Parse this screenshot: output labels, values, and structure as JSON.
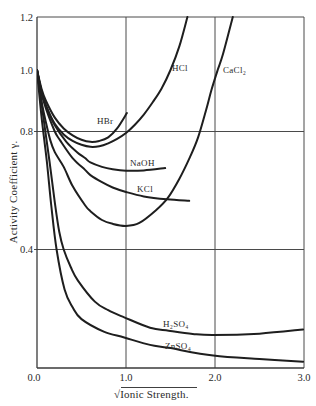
{
  "chart_data": {
    "type": "line",
    "title": "",
    "xlabel": "√Ionic Strength.",
    "ylabel": "Activity Coefficient γ.",
    "xlim": [
      0.0,
      3.0
    ],
    "ylim": [
      0.0,
      1.2
    ],
    "x_ticks": [
      {
        "value": 0.0,
        "label": "0.0"
      },
      {
        "value": 1.0,
        "label": "1.0"
      },
      {
        "value": 2.0,
        "label": "2.0"
      },
      {
        "value": 3.0,
        "label": "3.0"
      }
    ],
    "y_ticks": [
      {
        "value": 1.2,
        "label": "1.2"
      },
      {
        "value": 1.0,
        "label": "1.0"
      },
      {
        "value": 0.8,
        "label": "0.8"
      },
      {
        "value": 0.4,
        "label": "0.4"
      }
    ],
    "grid": {
      "x": [
        1.0,
        2.0,
        3.0
      ],
      "y": [
        0.4,
        0.8,
        1.2
      ]
    },
    "legend": "none — curves labeled inline",
    "series": [
      {
        "name": "HBr",
        "label_pos": [
          0.674,
          0.824
        ],
        "points": [
          [
            0,
            1.0
          ],
          [
            0.05,
            0.94
          ],
          [
            0.1,
            0.9
          ],
          [
            0.2,
            0.845
          ],
          [
            0.3,
            0.81
          ],
          [
            0.4,
            0.787
          ],
          [
            0.5,
            0.772
          ],
          [
            0.6,
            0.765
          ],
          [
            0.7,
            0.768
          ],
          [
            0.8,
            0.78
          ],
          [
            0.9,
            0.81
          ],
          [
            1.01,
            0.86
          ]
        ]
      },
      {
        "name": "HCl",
        "label_pos": [
          1.517,
          0.997
        ],
        "points": [
          [
            0,
            1.0
          ],
          [
            0.05,
            0.93
          ],
          [
            0.1,
            0.885
          ],
          [
            0.2,
            0.825
          ],
          [
            0.3,
            0.79
          ],
          [
            0.4,
            0.768
          ],
          [
            0.5,
            0.755
          ],
          [
            0.6,
            0.748
          ],
          [
            0.7,
            0.75
          ],
          [
            0.8,
            0.76
          ],
          [
            0.9,
            0.775
          ],
          [
            1.0,
            0.795
          ],
          [
            1.1,
            0.822
          ],
          [
            1.2,
            0.855
          ],
          [
            1.3,
            0.895
          ],
          [
            1.4,
            0.94
          ],
          [
            1.5,
            1.0
          ],
          [
            1.6,
            1.09
          ],
          [
            1.69,
            1.2
          ]
        ]
      },
      {
        "name": "CaCl₂",
        "label_pos": [
          2.09,
          0.99
        ],
        "points": [
          [
            0,
            1.0
          ],
          [
            0.05,
            0.9
          ],
          [
            0.1,
            0.83
          ],
          [
            0.15,
            0.77
          ],
          [
            0.2,
            0.73
          ],
          [
            0.3,
            0.68
          ],
          [
            0.4,
            0.615
          ],
          [
            0.54,
            0.55
          ],
          [
            0.6,
            0.53
          ],
          [
            0.73,
            0.5
          ],
          [
            0.85,
            0.487
          ],
          [
            1.0,
            0.48
          ],
          [
            1.15,
            0.49
          ],
          [
            1.34,
            0.534
          ],
          [
            1.47,
            0.575
          ],
          [
            1.6,
            0.64
          ],
          [
            1.72,
            0.714
          ],
          [
            1.81,
            0.78
          ],
          [
            1.9,
            0.87
          ],
          [
            1.96,
            0.935
          ],
          [
            2.03,
            1.0
          ],
          [
            2.09,
            1.06
          ],
          [
            2.2,
            1.2
          ]
        ]
      },
      {
        "name": "NaOH",
        "label_pos": [
          1.045,
          0.683
        ],
        "points": [
          [
            0,
            1.0
          ],
          [
            0.05,
            0.93
          ],
          [
            0.1,
            0.885
          ],
          [
            0.2,
            0.82
          ],
          [
            0.33,
            0.765
          ],
          [
            0.45,
            0.73
          ],
          [
            0.54,
            0.71
          ],
          [
            0.6,
            0.695
          ],
          [
            0.73,
            0.68
          ],
          [
            0.85,
            0.672
          ],
          [
            1.0,
            0.667
          ],
          [
            1.2,
            0.668
          ],
          [
            1.44,
            0.676
          ]
        ]
      },
      {
        "name": "KCl",
        "label_pos": [
          1.124,
          0.595
        ],
        "points": [
          [
            0,
            1.0
          ],
          [
            0.05,
            0.925
          ],
          [
            0.1,
            0.875
          ],
          [
            0.2,
            0.8
          ],
          [
            0.26,
            0.77
          ],
          [
            0.4,
            0.71
          ],
          [
            0.54,
            0.67
          ],
          [
            0.6,
            0.652
          ],
          [
            0.73,
            0.628
          ],
          [
            0.85,
            0.61
          ],
          [
            1.0,
            0.595
          ],
          [
            1.2,
            0.58
          ],
          [
            1.46,
            0.57
          ],
          [
            1.71,
            0.565
          ]
        ]
      },
      {
        "name": "H₂SO₄",
        "label_pos": [
          1.416,
          0.138
        ],
        "points": [
          [
            0,
            1.0
          ],
          [
            0.07,
            0.85
          ],
          [
            0.14,
            0.7
          ],
          [
            0.2,
            0.56
          ],
          [
            0.25,
            0.46
          ],
          [
            0.3,
            0.4
          ],
          [
            0.38,
            0.34
          ],
          [
            0.46,
            0.295
          ],
          [
            0.65,
            0.224
          ],
          [
            0.8,
            0.195
          ],
          [
            0.98,
            0.171
          ],
          [
            1.27,
            0.136
          ],
          [
            1.48,
            0.126
          ],
          [
            1.75,
            0.115
          ],
          [
            1.98,
            0.111
          ],
          [
            2.5,
            0.116
          ],
          [
            2.99,
            0.13
          ]
        ]
      },
      {
        "name": "ZnSO₄",
        "label_pos": [
          1.438,
          0.064
        ],
        "points": [
          [
            0,
            1.0
          ],
          [
            0.05,
            0.85
          ],
          [
            0.11,
            0.7
          ],
          [
            0.16,
            0.55
          ],
          [
            0.22,
            0.4
          ],
          [
            0.31,
            0.265
          ],
          [
            0.4,
            0.205
          ],
          [
            0.5,
            0.165
          ],
          [
            0.75,
            0.123
          ],
          [
            0.98,
            0.103
          ],
          [
            1.27,
            0.078
          ],
          [
            1.48,
            0.068
          ],
          [
            1.98,
            0.042
          ],
          [
            2.5,
            0.03
          ],
          [
            2.99,
            0.021
          ]
        ]
      }
    ]
  }
}
